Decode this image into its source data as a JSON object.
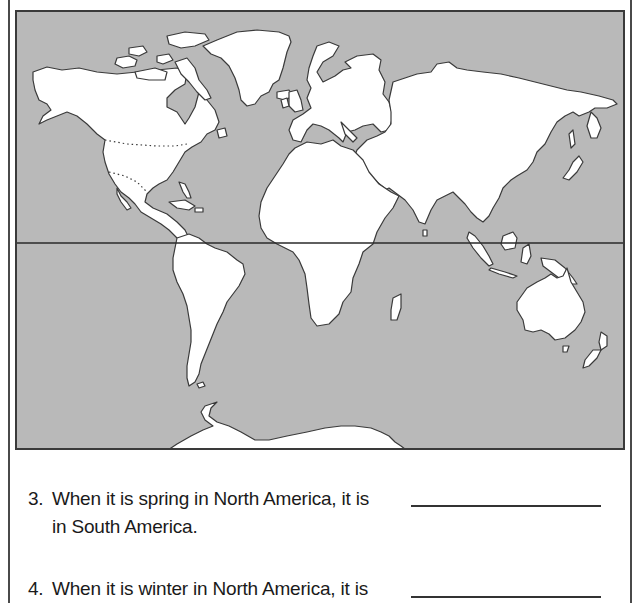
{
  "map": {
    "title": "World map",
    "ocean_color": "#b9b9b9",
    "land_color": "#ffffff",
    "outline_color": "#3a3a3a",
    "equator_label": "Equator line",
    "continents": [
      "North America",
      "South America",
      "Europe",
      "Africa",
      "Asia",
      "Australia",
      "Antarctica",
      "Greenland"
    ]
  },
  "questions": [
    {
      "number": "3.",
      "text": "When it is spring in North America, it is",
      "continuation": "in South America.",
      "answer": ""
    },
    {
      "number": "4.",
      "text": "When it is winter in North America, it is",
      "continuation": "",
      "answer": ""
    }
  ]
}
